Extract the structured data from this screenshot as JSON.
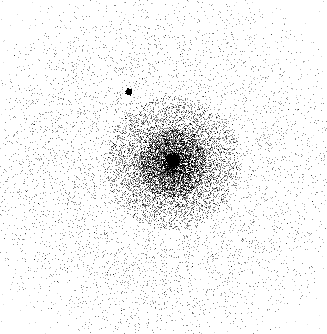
{
  "image": {
    "kind": "x-ray-photon-event-image",
    "width": 327,
    "height": 334,
    "background_color": "#ffffff",
    "event_color": "#000000",
    "colormap": "grayscale-inverted",
    "title": "",
    "axis_labels_visible": false,
    "colorbar_visible": false,
    "grid_visible": false,
    "annotations_visible": false
  },
  "chart_data": {
    "type": "scatter",
    "title": "",
    "subtitle": "",
    "xlabel": "",
    "ylabel": "",
    "xlim": [
      0,
      327
    ],
    "ylim": [
      0,
      334
    ],
    "grid": false,
    "legend_position": "none",
    "point_color": "#000000",
    "background": "#ffffff",
    "field_of_view": {
      "shape": "circle",
      "center_x": 166,
      "center_y": 166,
      "radius": 168
    },
    "components": [
      {
        "name": "central-point-source",
        "role": "primary bright point source",
        "x": 173,
        "y": 159,
        "core_radius_px": 2.6,
        "peak_intensity": 1.0,
        "wing_radius_px": 7,
        "counts_estimate": 260
      },
      {
        "name": "secondary-point-source",
        "role": "isolated faint point source",
        "x": 128.5,
        "y": 91.5,
        "core_radius_px": 2.2,
        "peak_intensity": 0.95,
        "wing_radius_px": 3,
        "counts_estimate": 40
      },
      {
        "name": "inner-halo",
        "role": "dense diffuse emission around core",
        "center_x": 172,
        "center_y": 163,
        "radius_px": 62,
        "counts_estimate": 6200,
        "relative_density": 1.0
      },
      {
        "name": "annular-gap",
        "role": "reduced-density ring",
        "center_x": 168,
        "center_y": 164,
        "inner_radius_px": 66,
        "outer_radius_px": 90,
        "relative_density": 0.3
      },
      {
        "name": "outer-halo",
        "role": "broad diffuse background emission",
        "center_x": 163,
        "center_y": 168,
        "inner_radius_px": 88,
        "outer_radius_px": 168,
        "counts_estimate": 7800,
        "relative_density": 0.42
      },
      {
        "name": "sparse-background",
        "role": "faint scattered events outside field",
        "counts_estimate": 400,
        "relative_density": 0.04
      }
    ],
    "total_events_estimate": 14700,
    "asymmetry": {
      "denser_quadrant": "lower-left",
      "sparser_quadrant": "upper-right",
      "note": "Outer halo is noticeably denser toward the lower-left and fainter toward the right edge."
    },
    "random_seed": 20240517
  }
}
